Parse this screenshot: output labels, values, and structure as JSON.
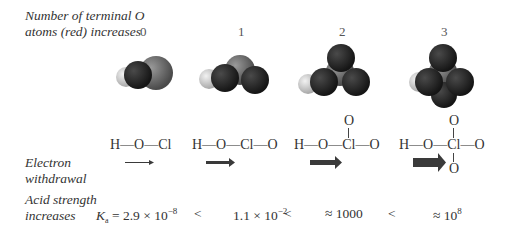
{
  "labels": {
    "terminal_o_line1": "Number of terminal O",
    "terminal_o_line2": "atoms (red) increases",
    "electron_line1": "Electron",
    "electron_line2": "withdrawal",
    "acid_line1": "Acid strength",
    "acid_line2": "increases"
  },
  "columns": [
    {
      "count": "0",
      "formula": "H—O—Cl",
      "ka": "= 2.9 × 10",
      "ka_exp": "−8",
      "ka_prefix": "K",
      "ka_sub": "a"
    },
    {
      "count": "1",
      "formula": "H—O—Cl—O",
      "ka": "1.1 × 10",
      "ka_exp": "−2"
    },
    {
      "count": "2",
      "formula": "H—O—Cl—O",
      "top_o": "O",
      "ka": "≈ 1000"
    },
    {
      "count": "3",
      "formula": "H—O—Cl—O",
      "top_o": "O",
      "bottom_o": "O",
      "ka": "≈ 10",
      "ka_exp": "8"
    }
  ],
  "comparators": [
    "<",
    "<",
    "<"
  ],
  "colors": {
    "oxygen": "#2a2a2a",
    "chlorine": "#7a7a7a",
    "hydrogen": "#d8d8d8",
    "arrow": "#3a3a3a"
  }
}
